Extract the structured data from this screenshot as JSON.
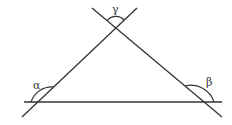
{
  "diagram": {
    "type": "triangle-exterior-angles",
    "stroke_color": "#333333",
    "background": "#ffffff",
    "labels": {
      "alpha": "α",
      "beta": "β",
      "gamma": "γ"
    }
  }
}
